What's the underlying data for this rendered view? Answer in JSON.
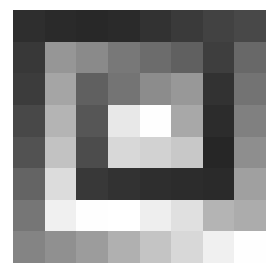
{
  "chart_data": {
    "type": "heatmap",
    "title": "",
    "xlabel": "",
    "ylabel": "",
    "colormap": "gray",
    "grid": false,
    "legend": null,
    "rows": 8,
    "cols": 8,
    "value_range": [
      0,
      255
    ],
    "values": [
      [
        46,
        42,
        40,
        42,
        50,
        58,
        66,
        72
      ],
      [
        56,
        150,
        138,
        120,
        108,
        96,
        62,
        104
      ],
      [
        60,
        165,
        96,
        116,
        140,
        152,
        50,
        115
      ],
      [
        72,
        180,
        86,
        232,
        254,
        168,
        44,
        128
      ],
      [
        82,
        194,
        76,
        216,
        210,
        200,
        38,
        142
      ],
      [
        100,
        220,
        56,
        50,
        46,
        44,
        42,
        160
      ],
      [
        118,
        240,
        254,
        255,
        238,
        224,
        180,
        172
      ],
      [
        132,
        144,
        156,
        176,
        196,
        216,
        240,
        254
      ]
    ]
  }
}
